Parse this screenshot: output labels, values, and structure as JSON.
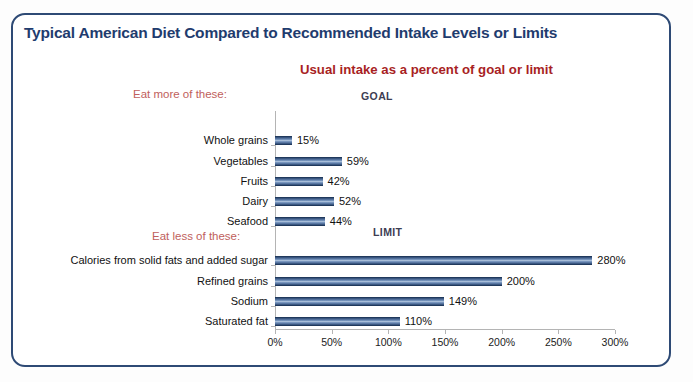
{
  "frame": {
    "border_color": "#2e4a75",
    "background": "#ffffff"
  },
  "title": "Typical American Diet Compared to Recommended Intake Levels or Limits",
  "subtitle": "Usual intake as a percent of goal or limit",
  "groups": {
    "more": {
      "note": "Eat more of these:",
      "axis_label": "GOAL"
    },
    "less": {
      "note": "Eat less of these:",
      "axis_label": "LIMIT"
    }
  },
  "colors": {
    "title": "#1f3c6e",
    "subtitle": "#a81f24",
    "group_note": "#c0605c",
    "group_axis_label": "#3d3d52",
    "bar_dark": "#2d4a73",
    "bar_light": "#a7bdd8",
    "axis": "#b4b4b4"
  },
  "chart_data": {
    "type": "bar",
    "orientation": "horizontal",
    "title": "Typical American Diet Compared to Recommended Intake Levels or Limits",
    "subtitle": "Usual intake as a percent of goal or limit",
    "xlabel": "",
    "ylabel": "",
    "xlim": [
      0,
      300
    ],
    "xticks": [
      0,
      50,
      100,
      150,
      200,
      250,
      300
    ],
    "xtick_labels": [
      "0%",
      "50%",
      "100%",
      "150%",
      "200%",
      "250%",
      "300%"
    ],
    "grid": false,
    "legend": false,
    "categories": [
      "Whole grains",
      "Vegetables",
      "Fruits",
      "Dairy",
      "Seafood",
      "Calories from solid fats and added sugar",
      "Refined grains",
      "Sodium",
      "Saturated fat"
    ],
    "values": [
      15,
      59,
      42,
      52,
      44,
      280,
      200,
      149,
      110
    ],
    "value_labels": [
      "15%",
      "59%",
      "42%",
      "52%",
      "44%",
      "280%",
      "200%",
      "149%",
      "110%"
    ],
    "groups": [
      {
        "name": "Eat more of these:",
        "reference": "GOAL",
        "categories": [
          "Whole grains",
          "Vegetables",
          "Fruits",
          "Dairy",
          "Seafood"
        ],
        "values": [
          15,
          59,
          42,
          52,
          44
        ]
      },
      {
        "name": "Eat less of these:",
        "reference": "LIMIT",
        "categories": [
          "Calories from solid fats and added sugar",
          "Refined grains",
          "Sodium",
          "Saturated fat"
        ],
        "values": [
          280,
          200,
          149,
          110
        ]
      }
    ],
    "rows": [
      {
        "label": "Whole grains",
        "value": 15,
        "value_label": "15%",
        "group": "GOAL",
        "y": 136
      },
      {
        "label": "Vegetables",
        "value": 59,
        "value_label": "59%",
        "group": "GOAL",
        "y": 157
      },
      {
        "label": "Fruits",
        "value": 42,
        "value_label": "42%",
        "group": "GOAL",
        "y": 177
      },
      {
        "label": "Dairy",
        "value": 52,
        "value_label": "52%",
        "group": "GOAL",
        "y": 197
      },
      {
        "label": "Seafood",
        "value": 44,
        "value_label": "44%",
        "group": "GOAL",
        "y": 217
      },
      {
        "label": "Calories from solid fats and added sugar",
        "value": 280,
        "value_label": "280%",
        "group": "LIMIT",
        "y": 256
      },
      {
        "label": "Refined grains",
        "value": 200,
        "value_label": "200%",
        "group": "LIMIT",
        "y": 277
      },
      {
        "label": "Sodium",
        "value": 149,
        "value_label": "149%",
        "group": "LIMIT",
        "y": 297
      },
      {
        "label": "Saturated fat",
        "value": 110,
        "value_label": "110%",
        "group": "LIMIT",
        "y": 317
      }
    ]
  }
}
